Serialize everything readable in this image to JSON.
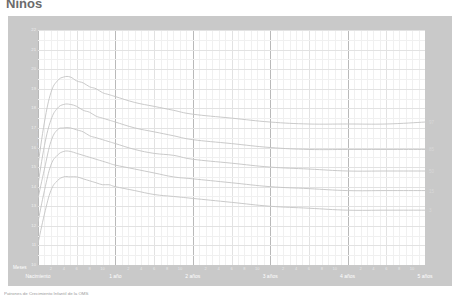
{
  "title": "Niños",
  "chart_data": {
    "type": "line",
    "title": "Niños",
    "subtitle": "IMC para la edad",
    "xlabel": "Edad (en meses y años cumplidos)",
    "ylabel": "IMC (kg/m²)",
    "x_unit_label": "Meses",
    "xlim": [
      0,
      60
    ],
    "ylim": [
      10,
      22
    ],
    "grid": true,
    "legend_position": "right-inline",
    "year_ticks": [
      {
        "value": 0,
        "label": "Nacimiento"
      },
      {
        "value": 12,
        "label": "1 año"
      },
      {
        "value": 24,
        "label": "2 años"
      },
      {
        "value": 36,
        "label": "3 años"
      },
      {
        "value": 48,
        "label": "4 años"
      },
      {
        "value": 60,
        "label": "5 años"
      }
    ],
    "month_ticks": [
      2,
      4,
      6,
      8,
      10,
      2,
      4,
      6,
      8,
      10,
      2,
      4,
      6,
      8,
      10,
      2,
      4,
      6,
      8,
      10,
      2,
      4,
      6,
      8,
      10
    ],
    "y_ticks": [
      10,
      11,
      12,
      13,
      14,
      15,
      16,
      17,
      18,
      19,
      20,
      21,
      22
    ],
    "x": [
      0,
      1,
      2,
      3,
      4,
      5,
      6,
      7,
      8,
      9,
      10,
      11,
      12,
      15,
      18,
      21,
      24,
      30,
      36,
      42,
      48,
      54,
      60
    ],
    "series": [
      {
        "name": "97",
        "label": "97",
        "color": "#c4c4c4",
        "values": [
          15.1,
          17.3,
          18.8,
          19.4,
          19.6,
          19.6,
          19.4,
          19.3,
          19.1,
          19.0,
          18.8,
          18.7,
          18.6,
          18.3,
          18.1,
          17.9,
          17.7,
          17.5,
          17.3,
          17.2,
          17.2,
          17.2,
          17.3
        ]
      },
      {
        "name": "85",
        "label": "85",
        "color": "#c4c4c4",
        "values": [
          14.1,
          16.1,
          17.4,
          18.0,
          18.2,
          18.2,
          18.1,
          17.9,
          17.8,
          17.6,
          17.5,
          17.4,
          17.3,
          17.0,
          16.8,
          16.6,
          16.4,
          16.2,
          16.0,
          15.9,
          15.9,
          15.9,
          15.9
        ]
      },
      {
        "name": "50",
        "label": "50",
        "color": "#c4c4c4",
        "values": [
          13.4,
          14.9,
          16.3,
          16.9,
          17.0,
          17.0,
          16.9,
          16.8,
          16.6,
          16.5,
          16.4,
          16.3,
          16.2,
          15.9,
          15.7,
          15.6,
          15.4,
          15.2,
          15.0,
          14.9,
          14.8,
          14.8,
          14.8
        ]
      },
      {
        "name": "15",
        "label": "15",
        "color": "#c4c4c4",
        "values": [
          12.2,
          13.8,
          15.1,
          15.6,
          15.8,
          15.8,
          15.7,
          15.6,
          15.5,
          15.4,
          15.3,
          15.2,
          15.1,
          14.9,
          14.7,
          14.5,
          14.4,
          14.2,
          14.0,
          13.9,
          13.8,
          13.8,
          13.8
        ]
      },
      {
        "name": "3",
        "label": "3",
        "color": "#c4c4c4",
        "values": [
          11.1,
          12.6,
          13.8,
          14.3,
          14.5,
          14.5,
          14.5,
          14.4,
          14.3,
          14.2,
          14.1,
          14.1,
          14.0,
          13.8,
          13.6,
          13.5,
          13.4,
          13.2,
          13.0,
          12.9,
          12.8,
          12.8,
          12.8
        ]
      }
    ]
  },
  "footnote": "Patrones de Crecimiento Infantil de la OMS"
}
